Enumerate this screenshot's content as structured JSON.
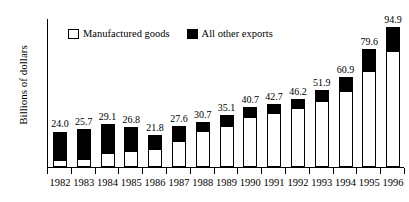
{
  "chart_data": {
    "type": "bar",
    "subtype": "stacked-vertical",
    "title": "",
    "subtitle": "",
    "xlabel": "",
    "ylabel": "Billions of dollars",
    "ylim": [
      0,
      100
    ],
    "yticks": [
      0,
      10,
      20,
      30,
      40,
      50,
      60,
      70,
      80,
      90,
      100
    ],
    "grid": false,
    "legend_position": "top-left-inside",
    "categories": [
      "1982",
      "1983",
      "1984",
      "1985",
      "1986",
      "1987",
      "1988",
      "1989",
      "1990",
      "1991",
      "1992",
      "1993",
      "1994",
      "1995",
      "1996"
    ],
    "totals": [
      24.0,
      25.7,
      29.1,
      26.8,
      21.8,
      27.6,
      30.7,
      35.1,
      40.7,
      42.7,
      46.2,
      51.9,
      60.9,
      79.6,
      94.9
    ],
    "total_labels": [
      "24.0",
      "25.7",
      "29.1",
      "26.8",
      "21.8",
      "27.6",
      "30.7",
      "35.1",
      "40.7",
      "42.7",
      "46.2",
      "51.9",
      "60.9",
      "79.6",
      "94.9"
    ],
    "series": [
      {
        "name": "Manufactured goods",
        "color": "#ffffff",
        "values": [
          4.1,
          4.6,
          8.5,
          10.2,
          11.4,
          17.0,
          23.4,
          27.3,
          32.9,
          35.6,
          38.9,
          43.8,
          50.8,
          64.3,
          77.4
        ]
      },
      {
        "name": "All other exports",
        "color": "#000000",
        "values": [
          19.9,
          21.1,
          20.6,
          16.6,
          10.4,
          10.6,
          7.3,
          7.8,
          7.8,
          7.1,
          7.3,
          8.1,
          10.1,
          15.3,
          17.5
        ]
      }
    ],
    "legend": [
      {
        "label": "Manufactured goods",
        "swatch": "white"
      },
      {
        "label": "All other exports",
        "swatch": "black"
      }
    ]
  }
}
